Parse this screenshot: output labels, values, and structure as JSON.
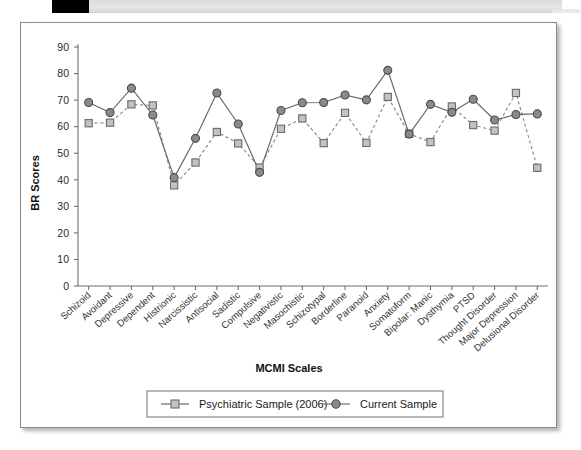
{
  "figure": {
    "header_strip": {
      "black_block": "",
      "gray_block": ""
    }
  },
  "chart_data": {
    "type": "line",
    "title": "",
    "xlabel": "MCMI Scales",
    "ylabel": "BR Scores",
    "ylim": [
      0,
      90
    ],
    "ytick_step": 10,
    "yticks": [
      "0",
      "10",
      "20",
      "30",
      "40",
      "50",
      "60",
      "70",
      "80",
      "90"
    ],
    "grid": false,
    "legend_position": "below-bottom-center",
    "categories": [
      "Schizoid",
      "Avoidant",
      "Depressive",
      "Dependent",
      "Histrionic",
      "Narcissistic",
      "Antisocial",
      "Sadistic",
      "Compulsive",
      "Negativistic",
      "Masochistic",
      "Schizotypal",
      "Borderline",
      "Paranoid",
      "Anxiety",
      "Somatoform",
      "Bipolar: Manic",
      "Dysthymia",
      "PTSD",
      "Thought Disorder",
      "Major Depression",
      "Delusional Disorder"
    ],
    "series": [
      {
        "name": "Psychiatric Sample (2006)",
        "marker": "square",
        "linestyle": "dashed",
        "color": "#c2c2c2",
        "values": [
          61.3,
          61.5,
          68.4,
          68.0,
          37.9,
          46.5,
          58.0,
          53.7,
          44.6,
          59.2,
          63.1,
          53.8,
          65.2,
          53.9,
          71.2,
          57.3,
          54.2,
          67.6,
          60.6,
          58.5,
          72.7,
          44.5
        ]
      },
      {
        "name": "Current Sample",
        "marker": "circle",
        "linestyle": "solid",
        "color": "#8a8a8a",
        "values": [
          69.1,
          65.3,
          74.5,
          64.4,
          40.8,
          55.6,
          72.7,
          61.0,
          42.8,
          66.1,
          69.0,
          69.1,
          71.9,
          70.1,
          81.2,
          57.2,
          68.4,
          65.4,
          70.3,
          62.5,
          64.6,
          64.8
        ]
      }
    ],
    "legend_entries": [
      {
        "label": "Psychiatric Sample (2006)",
        "marker": "square"
      },
      {
        "label": "Current Sample",
        "marker": "circle"
      }
    ]
  }
}
